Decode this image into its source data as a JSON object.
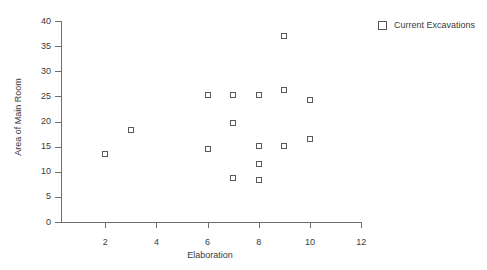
{
  "chart_data": {
    "type": "scatter",
    "title": "",
    "xlabel": "Elaboration",
    "ylabel": "Area of Main Room",
    "xlim": [
      0,
      12
    ],
    "ylim": [
      0,
      40
    ],
    "xticks": [
      2,
      4,
      6,
      8,
      10,
      12
    ],
    "yticks": [
      0,
      5,
      10,
      15,
      20,
      25,
      30,
      35,
      40
    ],
    "grid": false,
    "legend_position": "top-right",
    "marker": "open-square",
    "series": [
      {
        "name": "Current Excavations",
        "color": "#595959",
        "points": [
          {
            "x": 2,
            "y": 13.5
          },
          {
            "x": 3,
            "y": 18.3
          },
          {
            "x": 6,
            "y": 25.2
          },
          {
            "x": 6,
            "y": 14.5
          },
          {
            "x": 7,
            "y": 25.2
          },
          {
            "x": 7,
            "y": 19.7
          },
          {
            "x": 7,
            "y": 8.7
          },
          {
            "x": 8,
            "y": 25.2
          },
          {
            "x": 8,
            "y": 15.2
          },
          {
            "x": 8,
            "y": 11.5
          },
          {
            "x": 8,
            "y": 8.4
          },
          {
            "x": 9,
            "y": 37.0
          },
          {
            "x": 9,
            "y": 26.2
          },
          {
            "x": 9,
            "y": 15.2
          },
          {
            "x": 10,
            "y": 24.2
          },
          {
            "x": 10,
            "y": 16.5
          }
        ]
      }
    ]
  },
  "legend": {
    "entries": [
      {
        "label": "Current Excavations"
      }
    ]
  },
  "axes": {
    "x_title": "Elaboration",
    "y_title": "Area of Main Room",
    "x_tick_labels": [
      "2",
      "4",
      "6",
      "8",
      "10",
      "12"
    ],
    "y_tick_labels": [
      "0",
      "5",
      "10",
      "15",
      "20",
      "25",
      "30",
      "35",
      "40"
    ]
  }
}
